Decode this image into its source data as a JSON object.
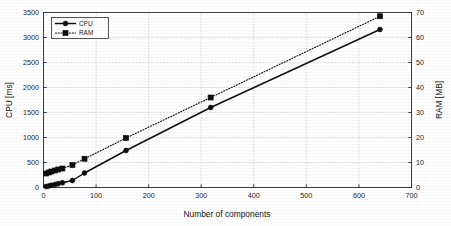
{
  "chart_data": {
    "type": "line",
    "title": "",
    "xlabel": "Number of components",
    "ylabel": "CPU [ms]",
    "y2label": "RAM [MB]",
    "xlim": [
      0,
      700
    ],
    "ylim": [
      0,
      3500
    ],
    "y2lim": [
      0,
      70
    ],
    "xticks": [
      0,
      100,
      200,
      300,
      400,
      500,
      600,
      700
    ],
    "xticklabels": [
      "0",
      "100",
      "200",
      "300",
      "400",
      "500",
      "600",
      "700"
    ],
    "yticks": [
      0,
      500,
      1000,
      1500,
      2000,
      2500,
      3000,
      3500
    ],
    "yticklabels": [
      "0",
      "500",
      "1000",
      "1500",
      "2000",
      "2500",
      "3000",
      "3500"
    ],
    "y2ticks": [
      0,
      10,
      20,
      30,
      40,
      50,
      60,
      70
    ],
    "y2ticklabels": [
      "0",
      "10",
      "20",
      "30",
      "40",
      "50",
      "60",
      "70"
    ],
    "grid": true,
    "grid_style": "dotted",
    "legend_position": "upper-left-inside",
    "x": [
      5,
      10,
      15,
      22,
      28,
      36,
      55,
      78,
      157,
      318,
      640
    ],
    "series": [
      {
        "name": "CPU",
        "axis": "left",
        "units": "ms",
        "linestyle": "solid",
        "marker": "circle",
        "color": "#0d0d0d",
        "values": [
          20,
          30,
          45,
          60,
          75,
          95,
          140,
          290,
          740,
          1600,
          3160
        ]
      },
      {
        "name": "RAM",
        "axis": "right",
        "units": "MB",
        "linestyle": "dotted",
        "marker": "square",
        "color": "#0d0d0d",
        "values": [
          5.6,
          6.0,
          6.4,
          6.8,
          7.2,
          7.6,
          9.0,
          11.5,
          19.8,
          36.0,
          68.5
        ]
      }
    ]
  },
  "legend": {
    "items": [
      {
        "label": "CPU",
        "marker": "circle",
        "linestyle": "solid"
      },
      {
        "label": "RAM",
        "marker": "square",
        "linestyle": "dotted"
      }
    ]
  },
  "colors": {
    "foreground": "#0d0d0d",
    "axis": "#2b2b2b",
    "grid": "#9a9a9a",
    "background": "#ffffff"
  }
}
